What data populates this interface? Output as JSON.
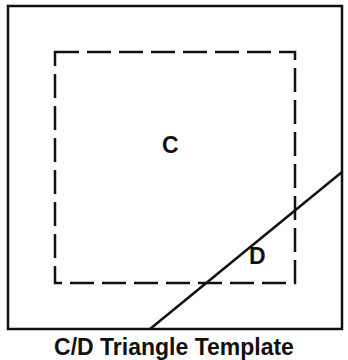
{
  "diagram": {
    "labels": {
      "region_c": "C",
      "region_d": "D"
    },
    "caption": "C/D Triangle Template",
    "colors": {
      "stroke": "#111111",
      "background": "#ffffff"
    },
    "shapes": {
      "outer_square": {
        "x": 8,
        "y": 6,
        "width": 334,
        "height": 323,
        "style": "solid"
      },
      "inner_square": {
        "x": 55,
        "y": 52,
        "width": 240,
        "height": 231,
        "style": "dashed"
      },
      "diagonal_line": {
        "x1": 150,
        "y1": 329,
        "x2": 342,
        "y2": 172
      }
    }
  }
}
